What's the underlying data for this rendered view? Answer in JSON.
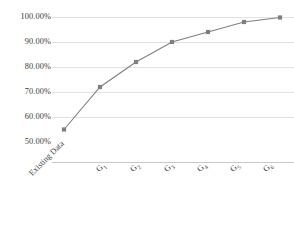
{
  "chart_data": {
    "type": "line",
    "title": "",
    "subtitle": "",
    "xlabel": "",
    "ylabel": "",
    "grid": true,
    "legend": false,
    "legend_position": "none",
    "marker": "square",
    "series_color": "#7f7f7f",
    "gridline_color": "#e2e2e2",
    "ylim": [
      50,
      100
    ],
    "ytick_labels": [
      "100.00%",
      "90.00%",
      "80.00%",
      "70.00%",
      "60.00%",
      "50.00%"
    ],
    "ytick_values": [
      100,
      90,
      80,
      70,
      60,
      50
    ],
    "categories": [
      "Existing Data",
      "G1",
      "G2",
      "G3",
      "G4",
      "G5",
      "G6"
    ],
    "category_labels": [
      {
        "base": "Existing Data",
        "sub": ""
      },
      {
        "base": "G",
        "sub": "1"
      },
      {
        "base": "G",
        "sub": "2"
      },
      {
        "base": "G",
        "sub": "3"
      },
      {
        "base": "G",
        "sub": "4"
      },
      {
        "base": "G",
        "sub": "5"
      },
      {
        "base": "G",
        "sub": "6"
      }
    ],
    "series": [
      {
        "name": "Cumulative coverage",
        "values": [
          55.0,
          72.0,
          82.0,
          90.0,
          94.0,
          98.0,
          99.8
        ]
      }
    ]
  }
}
